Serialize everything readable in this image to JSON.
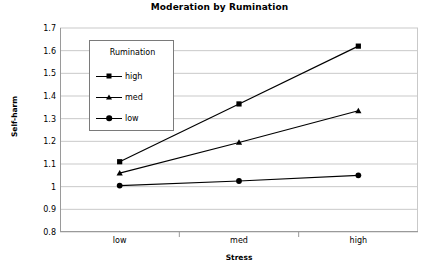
{
  "chart_data": {
    "type": "line",
    "title": "Moderation by Rumination",
    "xlabel": "Stress",
    "ylabel": "Self-harm",
    "categories": [
      "low",
      "med",
      "high"
    ],
    "ylim": [
      0.8,
      1.7
    ],
    "ytick_step": 0.1,
    "yticks": [
      "0.8",
      "0.9",
      "1",
      "1.1",
      "1.2",
      "1.3",
      "1.4",
      "1.5",
      "1.6",
      "1.7"
    ],
    "grid": "horizontal",
    "legend_position": "inside-upper-left",
    "legend_title": "Rumination",
    "series": [
      {
        "name": "high",
        "marker": "square",
        "color": "#000000",
        "values": [
          1.11,
          1.365,
          1.62
        ]
      },
      {
        "name": "med",
        "marker": "triangle",
        "color": "#000000",
        "values": [
          1.06,
          1.195,
          1.335
        ]
      },
      {
        "name": "low",
        "marker": "circle",
        "color": "#000000",
        "values": [
          1.005,
          1.025,
          1.05
        ]
      }
    ]
  },
  "legend": {
    "title": "Rumination",
    "items": [
      {
        "label": "high"
      },
      {
        "label": "med"
      },
      {
        "label": "low"
      }
    ]
  },
  "axes": {
    "title": "Moderation by Rumination",
    "x_title": "Stress",
    "y_title": "Self-harm"
  }
}
